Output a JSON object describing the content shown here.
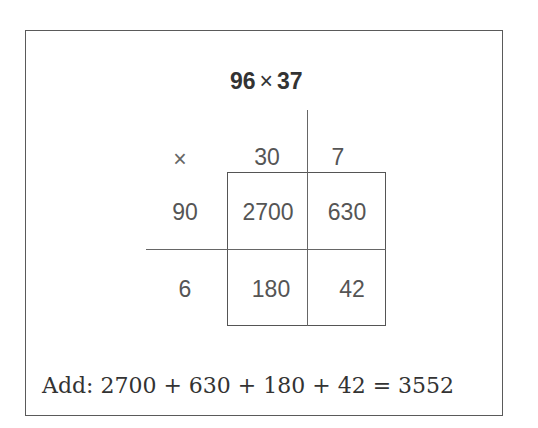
{
  "title": {
    "left": "96",
    "op": "×",
    "right": "37"
  },
  "header_row": {
    "symbol": "×",
    "cols": [
      "30",
      "7"
    ]
  },
  "rows": [
    {
      "label": "90",
      "cells": [
        "2700",
        "630"
      ]
    },
    {
      "label": "6",
      "cells": [
        "180",
        "42"
      ]
    }
  ],
  "sum_line": "Add: 2700 + 630 + 180 + 42 = 3552"
}
